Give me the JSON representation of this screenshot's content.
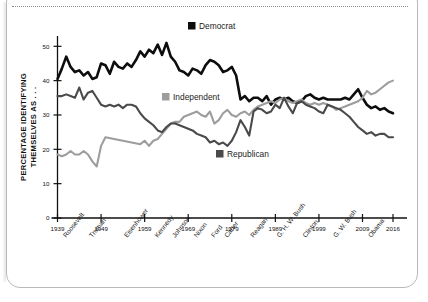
{
  "card": {
    "top_rule": "dotted-divider"
  },
  "chart_data": {
    "type": "line",
    "title": "",
    "xlabel": "",
    "ylabel": "PERCENTAGE IDENTIFYING THEMSELVES AS . . .",
    "ylabel_line1": "PERCENTAGE IDENTIFYING",
    "ylabel_line2": "THEMSELVES AS . . .",
    "xlim": [
      1939,
      2016
    ],
    "ylim": [
      0,
      53
    ],
    "yticks": [
      0,
      10,
      20,
      30,
      40,
      50
    ],
    "ytick_labels": [
      "0",
      "10",
      "20",
      "30",
      "40",
      "50"
    ],
    "xticks": [
      1939,
      1949,
      1959,
      1969,
      1979,
      1989,
      1999,
      2009,
      2016
    ],
    "xtick_labels": [
      "1939",
      "1949",
      "1959",
      "1969",
      "1979",
      "1989",
      "1999",
      "2009",
      "2016"
    ],
    "grid": false,
    "legend_position": "inside",
    "presidents": [
      "Roosevelt",
      "Truman",
      "Eisenhower",
      "Kennedy",
      "Johnson",
      "Nixon",
      "Ford",
      "Carter",
      "Reagan",
      "G. H. W. Bush",
      "Clinton",
      "G. W. Bush",
      "Obama"
    ],
    "president_years": [
      1941,
      1947,
      1955,
      1962,
      1966,
      1971,
      1975,
      1978,
      1984,
      1990,
      1996,
      2003,
      2011
    ],
    "colors": {
      "Democrat": "#0d0d0d",
      "Independent": "#9d9d9d",
      "Republican": "#4a4a4a"
    },
    "series": [
      {
        "name": "Democrat",
        "color": "#0d0d0d",
        "x": [
          1939,
          1940,
          1941,
          1942,
          1943,
          1944,
          1945,
          1946,
          1947,
          1948,
          1949,
          1950,
          1951,
          1952,
          1953,
          1954,
          1955,
          1956,
          1957,
          1958,
          1959,
          1960,
          1961,
          1962,
          1963,
          1964,
          1965,
          1966,
          1967,
          1968,
          1969,
          1970,
          1971,
          1972,
          1973,
          1974,
          1975,
          1976,
          1977,
          1978,
          1979,
          1980,
          1981,
          1982,
          1983,
          1984,
          1985,
          1986,
          1987,
          1988,
          1989,
          1990,
          1991,
          1992,
          1993,
          1994,
          1995,
          1996,
          1997,
          1998,
          1999,
          2000,
          2001,
          2002,
          2003,
          2004,
          2005,
          2006,
          2007,
          2008,
          2009,
          2010,
          2011,
          2012,
          2013,
          2014,
          2015,
          2016
        ],
        "values": [
          40.5,
          43.5,
          47.0,
          44.0,
          42.5,
          43.0,
          41.5,
          42.5,
          40.5,
          41.0,
          45.0,
          44.5,
          42.0,
          45.5,
          44.0,
          43.5,
          45.0,
          44.0,
          46.0,
          48.5,
          47.0,
          49.0,
          48.0,
          50.5,
          47.5,
          51.0,
          47.0,
          45.5,
          43.0,
          42.5,
          41.5,
          43.5,
          43.0,
          42.0,
          44.5,
          46.0,
          45.5,
          44.5,
          42.5,
          43.0,
          44.0,
          41.5,
          34.5,
          35.5,
          34.0,
          35.0,
          35.0,
          34.0,
          35.5,
          33.0,
          34.5,
          35.0,
          34.5,
          35.0,
          34.0,
          33.5,
          34.0,
          35.5,
          36.0,
          35.0,
          34.5,
          35.0,
          34.5,
          34.5,
          34.5,
          34.5,
          35.0,
          34.5,
          36.0,
          37.5,
          35.0,
          33.0,
          32.0,
          32.5,
          31.5,
          32.0,
          31.0,
          30.5
        ]
      },
      {
        "name": "Independent",
        "color": "#9d9d9d",
        "x": [
          1939,
          1940,
          1941,
          1942,
          1943,
          1944,
          1945,
          1946,
          1947,
          1948,
          1949,
          1950,
          1958,
          1959,
          1960,
          1961,
          1962,
          1963,
          1964,
          1965,
          1966,
          1967,
          1968,
          1969,
          1970,
          1971,
          1972,
          1973,
          1974,
          1975,
          1976,
          1977,
          1978,
          1979,
          1980,
          1981,
          1982,
          1983,
          1984,
          1985,
          1986,
          1987,
          1988,
          1989,
          1990,
          1991,
          1992,
          1993,
          1994,
          1995,
          1996,
          1997,
          1998,
          1999,
          2000,
          2001,
          2002,
          2003,
          2004,
          2005,
          2006,
          2007,
          2008,
          2009,
          2010,
          2011,
          2012,
          2013,
          2014,
          2015,
          2016
        ],
        "values": [
          18.5,
          18.0,
          18.5,
          19.5,
          18.5,
          18.5,
          19.5,
          18.5,
          16.5,
          15.0,
          21.0,
          23.5,
          21.5,
          22.5,
          21.0,
          22.5,
          23.0,
          24.5,
          26.0,
          27.5,
          28.0,
          28.0,
          29.5,
          30.0,
          30.5,
          31.0,
          30.0,
          29.5,
          31.0,
          27.5,
          28.5,
          30.5,
          31.5,
          30.0,
          29.5,
          30.5,
          31.0,
          30.0,
          31.5,
          32.5,
          33.0,
          33.5,
          34.0,
          33.5,
          34.5,
          35.0,
          34.0,
          33.5,
          34.0,
          34.5,
          33.5,
          33.0,
          33.5,
          33.0,
          33.5,
          33.0,
          32.5,
          31.5,
          32.0,
          32.5,
          33.0,
          33.5,
          34.0,
          35.0,
          37.0,
          36.0,
          36.5,
          37.5,
          38.5,
          39.5,
          40.0
        ]
      },
      {
        "name": "Republican",
        "color": "#4a4a4a",
        "x": [
          1939,
          1940,
          1941,
          1942,
          1943,
          1944,
          1945,
          1946,
          1947,
          1948,
          1949,
          1950,
          1951,
          1952,
          1953,
          1954,
          1955,
          1956,
          1957,
          1958,
          1959,
          1960,
          1961,
          1962,
          1963,
          1964,
          1965,
          1966,
          1967,
          1968,
          1969,
          1970,
          1971,
          1972,
          1973,
          1974,
          1975,
          1976,
          1977,
          1978,
          1979,
          1980,
          1981,
          1982,
          1983,
          1984,
          1985,
          1986,
          1987,
          1988,
          1989,
          1990,
          1991,
          1992,
          1993,
          1994,
          1995,
          1996,
          1997,
          1998,
          1999,
          2000,
          2001,
          2002,
          2003,
          2004,
          2005,
          2006,
          2007,
          2008,
          2009,
          2010,
          2011,
          2012,
          2013,
          2014,
          2015,
          2016
        ],
        "values": [
          35.5,
          35.5,
          36.0,
          35.5,
          35.0,
          38.0,
          34.5,
          36.5,
          37.0,
          35.0,
          33.0,
          32.5,
          33.0,
          32.5,
          33.0,
          32.0,
          33.0,
          33.0,
          32.5,
          30.5,
          29.0,
          28.0,
          27.0,
          25.5,
          25.0,
          26.5,
          27.5,
          27.5,
          27.0,
          26.5,
          26.0,
          25.5,
          24.5,
          24.0,
          23.5,
          22.0,
          22.5,
          21.5,
          22.0,
          21.0,
          22.5,
          25.0,
          28.5,
          26.5,
          24.0,
          31.0,
          32.0,
          31.5,
          30.5,
          31.0,
          33.0,
          32.0,
          35.0,
          32.5,
          30.5,
          33.5,
          34.0,
          33.0,
          32.5,
          32.0,
          31.0,
          30.5,
          33.0,
          32.5,
          32.0,
          31.5,
          30.5,
          29.5,
          28.0,
          26.5,
          25.5,
          24.5,
          25.0,
          24.0,
          24.5,
          24.5,
          23.5,
          23.5
        ]
      }
    ],
    "legend": [
      {
        "label": "Democrat",
        "color": "#0d0d0d",
        "swatch_x": 188,
        "swatch_y": 22
      },
      {
        "label": "Independent",
        "color": "#9d9d9d",
        "swatch_x": 162,
        "swatch_y": 93
      },
      {
        "label": "Republican",
        "color": "#4a4a4a",
        "swatch_x": 216,
        "swatch_y": 150
      }
    ]
  }
}
